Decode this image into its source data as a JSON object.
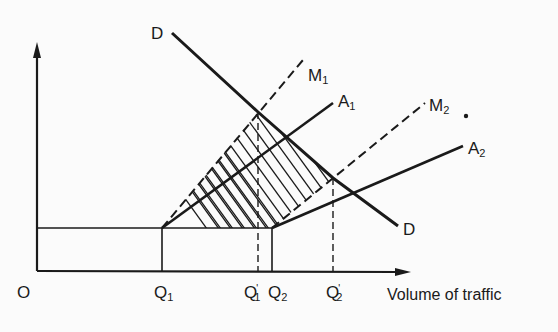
{
  "diagram": {
    "origin_label": "O",
    "x_axis_label": "Volume of traffic",
    "curves": {
      "demand_top": "D",
      "demand_bottom": "D",
      "marginal_cost_1": {
        "base": "M",
        "sub": "1"
      },
      "average_cost_1": {
        "base": "A",
        "sub": "1"
      },
      "marginal_cost_2": {
        "base": "M",
        "sub": "2"
      },
      "average_cost_2": {
        "base": "A",
        "sub": "2"
      }
    },
    "x_ticks": [
      {
        "base": "Q",
        "sub": "1",
        "prime": ""
      },
      {
        "base": "Q",
        "sub": "1",
        "prime": "'"
      },
      {
        "base": "Q",
        "sub": "2",
        "prime": ""
      },
      {
        "base": "Q",
        "sub": "2",
        "prime": "'"
      }
    ],
    "colors": {
      "ink": "#1a1a1a",
      "background": "#fbfbfb"
    }
  }
}
